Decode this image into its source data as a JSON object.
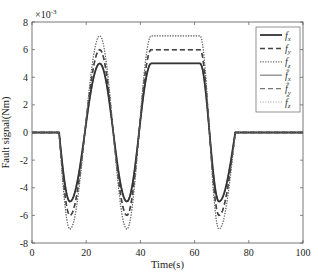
{
  "chart_data": {
    "type": "line",
    "title": "",
    "xlabel": "Time(s)",
    "ylabel": "Fault signal(Nm)",
    "y_exponent_label": "×10^-3",
    "xlim": [
      0,
      100
    ],
    "ylim": [
      -8,
      8
    ],
    "x_ticks": [
      0,
      20,
      40,
      60,
      80,
      100
    ],
    "y_ticks": [
      -8,
      -6,
      -4,
      -2,
      0,
      2,
      4,
      6,
      8
    ],
    "grid": false,
    "legend_position": "upper right inside",
    "x": [
      0,
      10,
      14,
      25,
      35,
      44,
      62,
      69,
      75,
      100
    ],
    "series": [
      {
        "name": "f_x",
        "style": "solid",
        "color": "#333333",
        "values": [
          0,
          0,
          -5,
          5,
          -5,
          5,
          5,
          -5,
          0,
          0
        ]
      },
      {
        "name": "f_y",
        "style": "dashed",
        "color": "#444444",
        "values": [
          0,
          0,
          -6,
          6,
          -6,
          6,
          6,
          -6,
          0,
          0
        ]
      },
      {
        "name": "f_z",
        "style": "dotted",
        "color": "#666666",
        "values": [
          0,
          0,
          -7,
          7,
          -7,
          7,
          7,
          -7,
          0,
          0
        ]
      },
      {
        "name": "f̂_x",
        "style": "solid",
        "color": "#888888",
        "values": [
          0,
          0,
          -5,
          5,
          -5,
          5,
          5,
          -5,
          0,
          0
        ]
      },
      {
        "name": "f̂_y",
        "style": "dashed",
        "color": "#777777",
        "values": [
          0,
          0,
          -6,
          6,
          -6,
          6,
          6,
          -6,
          0,
          0
        ]
      },
      {
        "name": "f̂_z",
        "style": "dotted",
        "color": "#aaaaaa",
        "values": [
          0,
          0,
          -7,
          7,
          -7,
          7,
          7,
          -7,
          0,
          0
        ]
      }
    ]
  },
  "legend": {
    "entries": [
      "f",
      "f",
      "f",
      "f̂",
      "f̂",
      "f̂"
    ],
    "subscripts": [
      "x",
      "y",
      "z",
      "x",
      "y",
      "z"
    ]
  },
  "axes": {
    "x_tick_labels": [
      "0",
      "20",
      "40",
      "60",
      "80",
      "100"
    ],
    "y_tick_labels": [
      "8",
      "6",
      "4",
      "2",
      "0",
      "-2",
      "-4",
      "-6",
      "-8"
    ],
    "exponent_base": "×10",
    "exponent_power": "-3"
  }
}
